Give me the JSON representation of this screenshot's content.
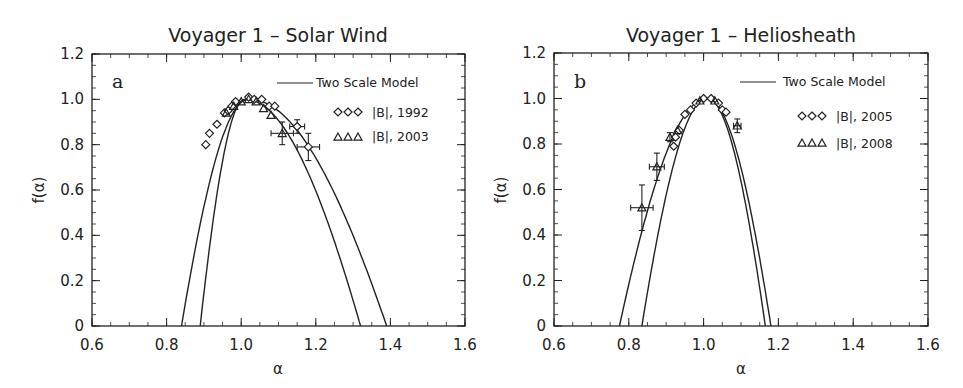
{
  "chart_data": [
    {
      "type": "line",
      "panel_label": "a",
      "title": "Voyager 1 – Solar Wind",
      "xlabel": "α",
      "ylabel": "f(α)",
      "xlim": [
        0.6,
        1.6
      ],
      "ylim": [
        0,
        1.2
      ],
      "xticks": [
        "0.6",
        "0.8",
        "1.0",
        "1.2",
        "1.4",
        "1.6"
      ],
      "yticks": [
        "0",
        "0.2",
        "0.4",
        "0.6",
        "0.8",
        "1.0",
        "1.2"
      ],
      "grid": false,
      "legend": {
        "position": "upper right",
        "entries": [
          "Two Scale Model",
          "|B|, 1992",
          "|B|, 2003"
        ]
      },
      "series": [
        {
          "name": "Two Scale Model (1992)",
          "kind": "curve",
          "alpha_min": 0.84,
          "alpha_max": 1.39,
          "alpha_peak": 1.02
        },
        {
          "name": "Two Scale Model (2003)",
          "kind": "curve",
          "alpha_min": 0.89,
          "alpha_max": 1.32,
          "alpha_peak": 1.01
        },
        {
          "name": "|B|, 1992",
          "kind": "diamond",
          "x": [
            0.905,
            0.915,
            0.935,
            0.955,
            0.965,
            0.975,
            0.985,
            1.02,
            1.035,
            1.055,
            1.075,
            1.09,
            1.15,
            1.18
          ],
          "y": [
            0.8,
            0.85,
            0.89,
            0.94,
            0.95,
            0.97,
            0.99,
            1.01,
            1.0,
            1.0,
            0.97,
            0.97,
            0.88,
            0.79
          ],
          "xerr": [
            0,
            0,
            0,
            0,
            0,
            0,
            0,
            0,
            0,
            0,
            0,
            0,
            0.02,
            0.03
          ],
          "yerr": [
            0,
            0,
            0,
            0,
            0,
            0,
            0,
            0,
            0,
            0,
            0,
            0,
            0.03,
            0.06
          ]
        },
        {
          "name": "|B|, 2003",
          "kind": "triangle",
          "x": [
            0.96,
            0.98,
            1.0,
            1.02,
            1.04,
            1.06,
            1.08,
            1.11
          ],
          "y": [
            0.94,
            0.97,
            0.99,
            1.0,
            0.99,
            0.96,
            0.93,
            0.85
          ],
          "xerr": [
            0,
            0,
            0,
            0,
            0,
            0,
            0,
            0.03
          ],
          "yerr": [
            0,
            0,
            0,
            0,
            0,
            0,
            0,
            0.05
          ]
        }
      ]
    },
    {
      "type": "line",
      "panel_label": "b",
      "title": "Voyager 1 – Heliosheath",
      "xlabel": "α",
      "ylabel": "f(α)",
      "xlim": [
        0.6,
        1.6
      ],
      "ylim": [
        0,
        1.2
      ],
      "xticks": [
        "0.6",
        "0.8",
        "1.0",
        "1.2",
        "1.4",
        "1.6"
      ],
      "yticks": [
        "0",
        "0.2",
        "0.4",
        "0.6",
        "0.8",
        "1.0",
        "1.2"
      ],
      "grid": false,
      "legend": {
        "position": "upper right",
        "entries": [
          "Two Scale Model",
          "|B|, 2005",
          "|B|, 2008"
        ]
      },
      "series": [
        {
          "name": "Two Scale Model (2008)",
          "kind": "curve",
          "alpha_min": 0.775,
          "alpha_max": 1.18,
          "alpha_peak": 1.01
        },
        {
          "name": "Two Scale Model (2005)",
          "kind": "curve",
          "alpha_min": 0.835,
          "alpha_max": 1.165,
          "alpha_peak": 1.01
        },
        {
          "name": "|B|, 2005",
          "kind": "diamond",
          "x": [
            0.92,
            0.925,
            0.935,
            0.95,
            0.965,
            0.98,
            1.0,
            1.02,
            1.04,
            1.05,
            1.06
          ],
          "y": [
            0.79,
            0.83,
            0.86,
            0.93,
            0.95,
            0.98,
            1.0,
            1.0,
            0.98,
            0.95,
            0.94
          ],
          "xerr": [
            0,
            0,
            0,
            0,
            0,
            0,
            0,
            0,
            0,
            0,
            0
          ],
          "yerr": [
            0,
            0,
            0,
            0,
            0,
            0,
            0,
            0,
            0,
            0,
            0
          ]
        },
        {
          "name": "|B|, 2008",
          "kind": "triangle",
          "x": [
            0.835,
            0.875,
            0.91,
            0.93,
            0.99,
            1.03,
            1.09
          ],
          "y": [
            0.52,
            0.7,
            0.83,
            0.86,
            0.99,
            0.99,
            0.88
          ],
          "xerr": [
            0.03,
            0.02,
            0,
            0,
            0,
            0,
            0.01
          ],
          "yerr": [
            0.1,
            0.06,
            0.02,
            0,
            0,
            0,
            0.03
          ]
        }
      ]
    }
  ],
  "panels": [
    {
      "label": "a",
      "title": "Voyager 1 – Solar Wind",
      "xlabel": "α",
      "ylabel": "f(α)",
      "legend": [
        "Two Scale Model",
        "|B|, 1992",
        "|B|, 2003"
      ]
    },
    {
      "label": "b",
      "title": "Voyager 1 – Heliosheath",
      "xlabel": "α",
      "ylabel": "f(α)",
      "legend": [
        "Two Scale Model",
        "|B|, 2005",
        "|B|, 2008"
      ]
    }
  ]
}
